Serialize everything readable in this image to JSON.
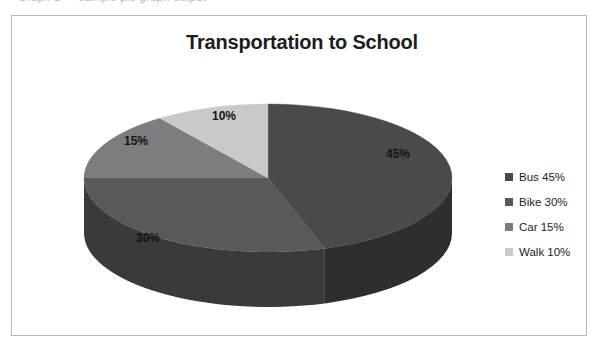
{
  "top_clip": {
    "text": "Graph 1 — sample pie graph output"
  },
  "frame": {
    "border_color": "#b6b6b6",
    "background": "#ffffff"
  },
  "chart": {
    "title": "Transportation to School"
  },
  "labels": {
    "bus": "45%",
    "bike": "30%",
    "car": "15%",
    "walk": "10%"
  },
  "legend": {
    "position": "right",
    "items": [
      {
        "label": "Bus 45%",
        "color": "#4a4a4a"
      },
      {
        "label": "Bike 30%",
        "color": "#595959"
      },
      {
        "label": "Car 15%",
        "color": "#7d7d7d"
      },
      {
        "label": "Walk 10%",
        "color": "#c9c9c9"
      }
    ]
  },
  "chart_data": {
    "type": "pie",
    "title": "Transportation to School",
    "subtitle": "",
    "xlabel": "",
    "ylabel": "",
    "three_d": true,
    "start_angle_deg": 0,
    "direction": "clockwise",
    "legend_position": "right",
    "grid": false,
    "data_labels": "percent",
    "categories": [
      "Bus",
      "Bike",
      "Car",
      "Walk"
    ],
    "values": [
      45,
      30,
      15,
      10
    ],
    "units": "percent",
    "total": 100,
    "slices": [
      {
        "name": "Bus",
        "value": 45,
        "label": "45%",
        "legend": "Bus 45%",
        "top_color": "#4a4a4a",
        "side_color": "#2e2e2e"
      },
      {
        "name": "Bike",
        "value": 30,
        "label": "30%",
        "legend": "Bike 30%",
        "top_color": "#595959",
        "side_color": "#3a3a3a"
      },
      {
        "name": "Car",
        "value": 15,
        "label": "15%",
        "legend": "Car 15%",
        "top_color": "#7d7d7d",
        "side_color": "#565656"
      },
      {
        "name": "Walk",
        "value": 10,
        "label": "10%",
        "legend": "Walk 10%",
        "top_color": "#c9c9c9",
        "side_color": "#8e8e8e"
      }
    ]
  }
}
